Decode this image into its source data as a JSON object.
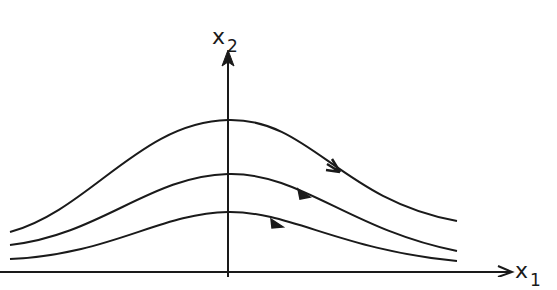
{
  "diagram": {
    "type": "phase-portrait",
    "axes": {
      "x_label": "x",
      "x_label_sub": "1",
      "y_label": "x",
      "y_label_sub": "2"
    },
    "trajectories": [
      {
        "name": "outer",
        "peak_y": 120,
        "left_y": 232,
        "right_y": 221,
        "arrow_at": [
          335,
          170
        ]
      },
      {
        "name": "middle",
        "peak_y": 174,
        "left_y": 245,
        "right_y": 251,
        "arrow_at": [
          305,
          195
        ]
      },
      {
        "name": "inner",
        "peak_y": 212,
        "left_y": 259,
        "right_y": 261,
        "arrow_at": [
          278,
          225
        ]
      }
    ],
    "stroke_color": "#1a1a1a"
  }
}
